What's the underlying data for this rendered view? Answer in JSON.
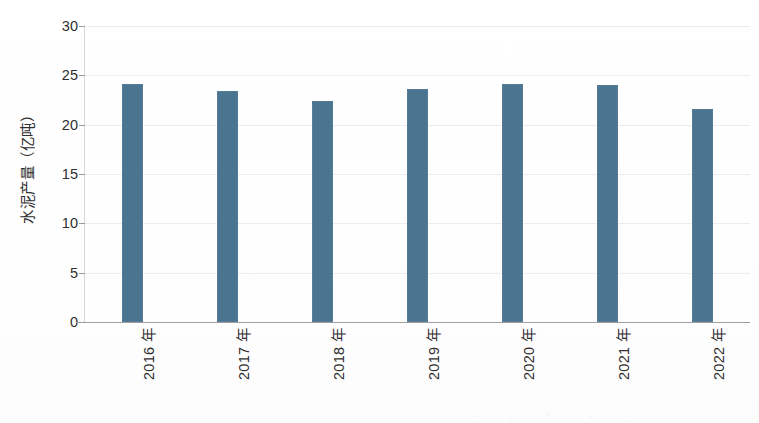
{
  "chart_data": {
    "type": "bar",
    "title": "",
    "subtitle": "",
    "xlabel": "",
    "ylabel": "水泥产量（亿吨）",
    "categories": [
      "2016 年",
      "2017 年",
      "2018 年",
      "2019 年",
      "2020 年",
      "2021 年",
      "2022 年"
    ],
    "values": [
      24.1,
      23.4,
      22.4,
      23.6,
      24.1,
      24.0,
      21.6
    ],
    "series": [
      {
        "name": "水泥产量",
        "values": [
          24.1,
          23.4,
          22.4,
          23.6,
          24.1,
          24.0,
          21.6
        ]
      }
    ],
    "ylim": [
      0,
      30
    ],
    "ytick_labels": [
      "0",
      "5",
      "10",
      "15",
      "20",
      "25",
      "30"
    ],
    "ytick_values": [
      0,
      5,
      10,
      15,
      20,
      25,
      30
    ],
    "grid": true,
    "grid_axis": "y",
    "legend": false,
    "legend_position": "none",
    "bar_color": "#4a7490",
    "background_color": "#fdfdfd",
    "axis_color": "#9e9e9e",
    "grid_color": "#ececec",
    "text_color": "#2f2f2f",
    "annotations": [],
    "data_labels": false
  },
  "axes": {
    "y_title": "水泥产量（亿吨）",
    "y_ticks": [
      {
        "label": "30",
        "value": 30
      },
      {
        "label": "25",
        "value": 25
      },
      {
        "label": "20",
        "value": 20
      },
      {
        "label": "15",
        "value": 15
      },
      {
        "label": "10",
        "value": 10
      },
      {
        "label": "5",
        "value": 5
      },
      {
        "label": "0",
        "value": 0
      }
    ],
    "x_ticks": [
      {
        "label": "2016 年"
      },
      {
        "label": "2017 年"
      },
      {
        "label": "2018 年"
      },
      {
        "label": "2019 年"
      },
      {
        "label": "2020 年"
      },
      {
        "label": "2021 年"
      },
      {
        "label": "2022 年"
      }
    ]
  }
}
